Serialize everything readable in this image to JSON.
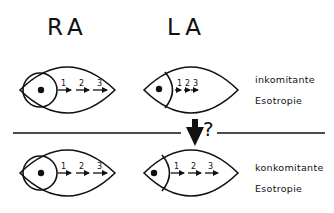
{
  "headers": {
    "right_eye": "RA",
    "left_eye": "LA"
  },
  "rows": [
    {
      "label_line1": "inkomitante",
      "label_line2": "Esotropie",
      "right_eye_gaze_steps": [
        "1",
        "2",
        "3"
      ],
      "left_eye_gaze_steps": [
        "1",
        "2",
        "3"
      ]
    },
    {
      "label_line1": "konkomitante",
      "label_line2": "Esotropie",
      "right_eye_gaze_steps": [
        "1",
        "2",
        "3"
      ],
      "left_eye_gaze_steps": [
        "1",
        "2",
        "3"
      ]
    }
  ],
  "transition": {
    "symbol": "?"
  },
  "colors": {
    "ink": "#111111",
    "background": "#ffffff"
  }
}
